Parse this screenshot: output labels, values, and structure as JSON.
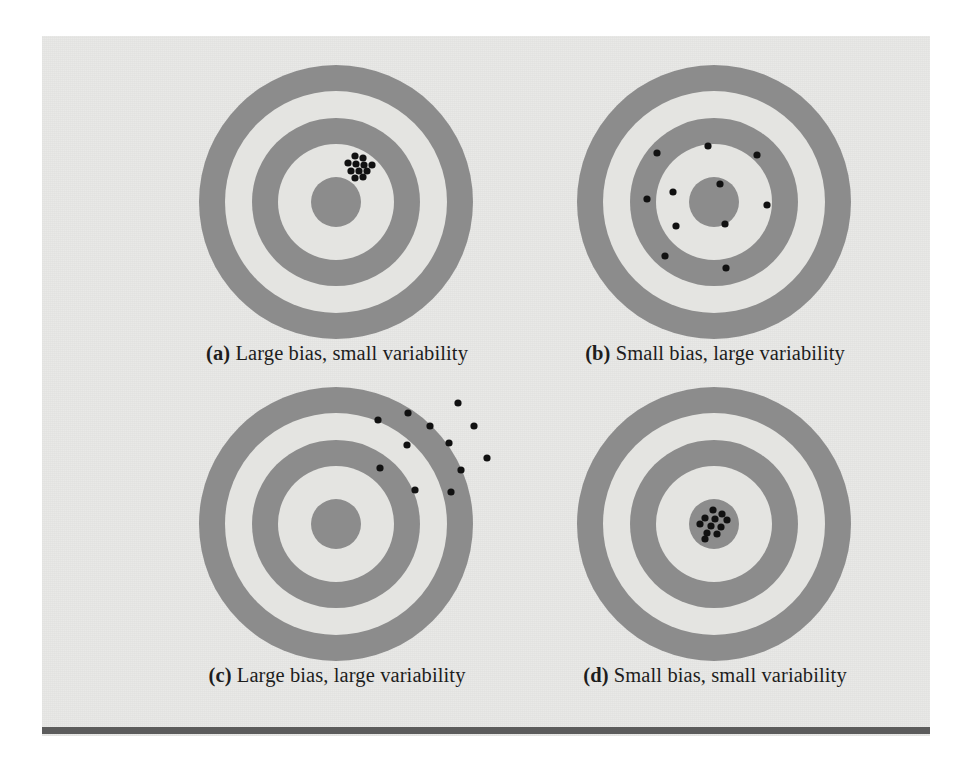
{
  "figure": {
    "background_color": "#e9e9e7",
    "ring_color": "#8c8c8c",
    "ring_gap_color": "#e4e4e1",
    "shot_color": "#111111",
    "rule_color": "#5c5c5c"
  },
  "panels": [
    {
      "id": "a",
      "label": "(a)",
      "caption": "Large bias, small variability",
      "caption_full": "(a) Large bias, small variability",
      "bias": "large",
      "variability": "small",
      "shots": [
        [
          19,
          -46
        ],
        [
          27,
          -44
        ],
        [
          12,
          -39
        ],
        [
          20,
          -38
        ],
        [
          28,
          -37
        ],
        [
          36,
          -37
        ],
        [
          15,
          -31
        ],
        [
          23,
          -31
        ],
        [
          31,
          -31
        ],
        [
          19,
          -24
        ],
        [
          27,
          -25
        ]
      ]
    },
    {
      "id": "b",
      "label": "(b)",
      "caption": "Small bias, large variability",
      "caption_full": "(b) Small bias, large variability",
      "bias": "small",
      "variability": "large",
      "shots": [
        [
          -57,
          -49
        ],
        [
          -6,
          -56
        ],
        [
          43,
          -47
        ],
        [
          6,
          -18
        ],
        [
          -41,
          -10
        ],
        [
          -67,
          -3
        ],
        [
          53,
          3
        ],
        [
          -38,
          24
        ],
        [
          11,
          22
        ],
        [
          -49,
          54
        ],
        [
          12,
          66
        ]
      ]
    },
    {
      "id": "c",
      "label": "(c)",
      "caption": "Large bias, large variability",
      "caption_full": "(c) Large bias, large variability",
      "bias": "large",
      "variability": "large",
      "shots": [
        [
          122,
          -121
        ],
        [
          72,
          -111
        ],
        [
          42,
          -104
        ],
        [
          94,
          -98
        ],
        [
          138,
          -98
        ],
        [
          71,
          -79
        ],
        [
          113,
          -81
        ],
        [
          151,
          -66
        ],
        [
          44,
          -56
        ],
        [
          125,
          -54
        ],
        [
          79,
          -34
        ],
        [
          115,
          -32
        ]
      ]
    },
    {
      "id": "d",
      "label": "(d)",
      "caption": "Small bias, small variability",
      "caption_full": "(d) Small bias, small variability",
      "bias": "small",
      "variability": "small",
      "shots": [
        [
          -1,
          -14
        ],
        [
          8,
          -10
        ],
        [
          -9,
          -6
        ],
        [
          1,
          -5
        ],
        [
          13,
          -4
        ],
        [
          -14,
          0
        ],
        [
          -3,
          2
        ],
        [
          7,
          3
        ],
        [
          -7,
          9
        ],
        [
          3,
          10
        ],
        [
          -9,
          15
        ]
      ]
    }
  ],
  "geometry": {
    "outer_radius": 137,
    "ring1_inner_radius": 111,
    "ring2_outer_radius": 84,
    "ring2_inner_radius": 58,
    "bullseye_radius": 25,
    "shot_radius": 3.6
  }
}
